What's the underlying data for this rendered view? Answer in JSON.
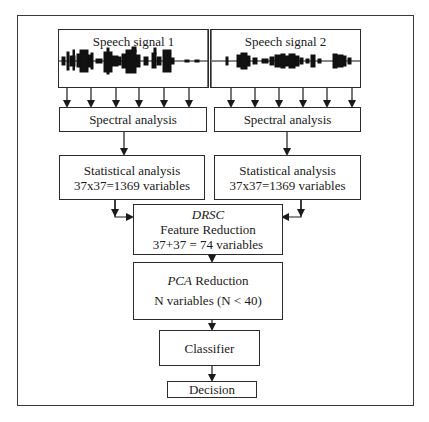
{
  "diagram": {
    "signals": [
      {
        "label": "Speech signal 1"
      },
      {
        "label": "Speech signal 2"
      }
    ],
    "spectral": [
      {
        "label": "Spectral analysis"
      },
      {
        "label": "Spectral analysis"
      }
    ],
    "statistical": [
      {
        "line1": "Statistical analysis",
        "line2": "37x37=1369 variables"
      },
      {
        "line1": "Statistical analysis",
        "line2": "37x37=1369 variables"
      }
    ],
    "drsc": {
      "title": "DRSC",
      "line1": "Feature Reduction",
      "line2": "37+37 = 74 variables"
    },
    "pca": {
      "title": "PCA",
      "title_suffix": " Reduction",
      "line2": "N variables (N < 40)"
    },
    "classifier": {
      "label": "Classifier"
    },
    "decision": {
      "label": "Decision"
    },
    "colors": {
      "stroke": "#2a2a2a",
      "frame": "#3a3a3a",
      "background": "#ffffff",
      "waveform": "#111111"
    }
  }
}
